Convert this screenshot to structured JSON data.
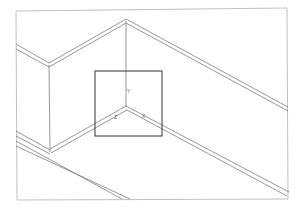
{
  "viewport": {
    "view": "isometric",
    "background": "#ffffff",
    "line_color": "#6a6a6a",
    "frame_color": "#a8a8a8",
    "ucs_box_color": "#333333"
  },
  "ucs_icon": {
    "x_label": "X",
    "y_label": "Y",
    "z_label": "Z"
  }
}
